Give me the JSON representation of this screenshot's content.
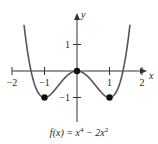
{
  "chart_data": {
    "type": "line",
    "title": "",
    "function": "x^4 - 2x^2",
    "caption": {
      "lhs": "f(x) = x",
      "exp1": "4",
      "mid": " − 2x",
      "exp2": "2"
    },
    "xlabel": "x",
    "ylabel": "y",
    "xlim": [
      -2.3,
      2.3
    ],
    "ylim": [
      -1.8,
      1.8
    ],
    "x_ticks": [
      {
        "value": -2,
        "label": "−2"
      },
      {
        "value": -1,
        "label": "−1"
      },
      {
        "value": 1,
        "label": "1"
      },
      {
        "value": 2,
        "label": "2"
      }
    ],
    "y_ticks": [
      {
        "value": 1,
        "label": "1"
      },
      {
        "value": -1,
        "label": "−1"
      }
    ],
    "series": [
      {
        "name": "f(x)",
        "x_range": [
          -1.63,
          1.63
        ],
        "color": "#555555"
      }
    ],
    "points": [
      {
        "x": -1,
        "y": -1
      },
      {
        "x": 0,
        "y": 0
      },
      {
        "x": 1,
        "y": -1
      }
    ],
    "grid": false,
    "legend": "none"
  }
}
